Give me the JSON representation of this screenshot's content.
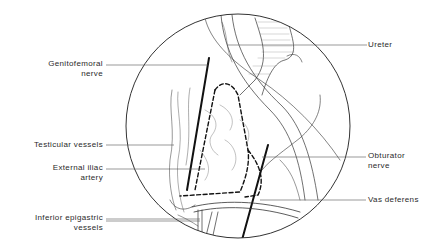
{
  "figure": {
    "type": "anatomical line illustration",
    "view": "circular laparoscopic field",
    "colors": {
      "ink": "#2a2a2a",
      "background": "#ffffff"
    }
  },
  "labels": {
    "genitofemoral": {
      "line1": "Genitofemoral",
      "line2": "nerve"
    },
    "ureter": {
      "line1": "Ureter"
    },
    "testicular": {
      "line1": "Testicular vessels"
    },
    "external_iliac": {
      "line1": "External iliac",
      "line2": "artery"
    },
    "obturator": {
      "line1": "Obturator",
      "line2": "nerve"
    },
    "vas_deferens": {
      "line1": "Vas deferens"
    },
    "inferior_epigastric": {
      "line1": "Inferior epigastric",
      "line2": "vessels"
    }
  }
}
